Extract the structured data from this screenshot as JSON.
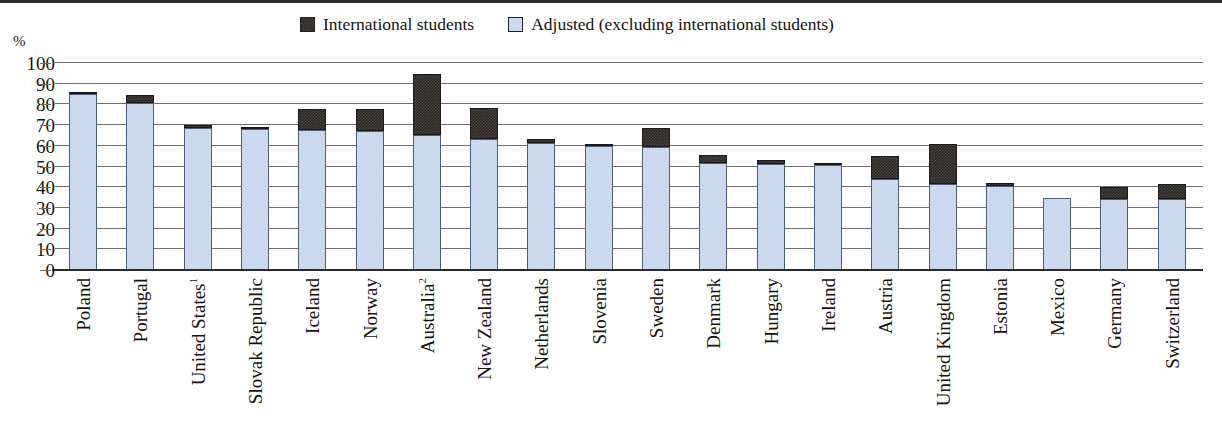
{
  "chart_data": {
    "type": "bar",
    "subtype": "stacked-bar",
    "title": "",
    "xlabel": "",
    "ylabel": "%",
    "ylim": [
      0,
      100
    ],
    "yticks": [
      0,
      10,
      20,
      30,
      40,
      50,
      60,
      70,
      80,
      90,
      100
    ],
    "grid": true,
    "legend_position": "top-center",
    "categories": [
      "Poland",
      "Portugal",
      "United States",
      "Slovak Republic",
      "Iceland",
      "Norway",
      "Australia",
      "New Zealand",
      "Netherlands",
      "Slovenia",
      "Sweden",
      "Denmark",
      "Hungary",
      "Ireland",
      "Austria",
      "United Kingdom",
      "Estonia",
      "Mexico",
      "Germany",
      "Switzerland"
    ],
    "category_footnotes": {
      "United States": "1",
      "Australia": "2"
    },
    "series": [
      {
        "name": "Adjusted (excluding international students)",
        "color": "#c3d3ec",
        "values": [
          85.0,
          80.5,
          68.5,
          68.0,
          67.5,
          67.0,
          65.0,
          63.5,
          61.5,
          60.0,
          59.5,
          51.5,
          51.0,
          50.5,
          44.0,
          41.5,
          40.5,
          35.0,
          34.5,
          34.5
        ]
      },
      {
        "name": "International students",
        "color": "#2a2724",
        "values": [
          1.0,
          4.0,
          1.5,
          1.0,
          10.5,
          11.0,
          29.5,
          15.0,
          2.0,
          1.0,
          9.0,
          4.0,
          2.0,
          1.0,
          11.0,
          19.5,
          1.5,
          0.0,
          5.5,
          7.0
        ]
      }
    ],
    "totals": [
      86.0,
      84.5,
      70.0,
      69.0,
      78.0,
      78.0,
      94.5,
      78.5,
      63.5,
      61.0,
      68.5,
      55.5,
      53.0,
      51.5,
      55.0,
      61.0,
      42.0,
      35.0,
      40.0,
      41.5
    ]
  },
  "legend": {
    "entries": [
      {
        "label": "International students",
        "swatch": "dark"
      },
      {
        "label": "Adjusted (excluding international students)",
        "swatch": "blue"
      }
    ]
  },
  "axis": {
    "y_unit_label": "%",
    "y_tick_labels": [
      "100",
      "90",
      "80",
      "70",
      "60",
      "50",
      "40",
      "30",
      "20",
      "10",
      "0"
    ]
  },
  "colors": {
    "series_international": "#2a2724",
    "series_adjusted": "#c3d3ec",
    "gridline": "#6e6e6e",
    "axis": "#2b2b2b",
    "text": "#16130f",
    "background": "#ffffff"
  }
}
